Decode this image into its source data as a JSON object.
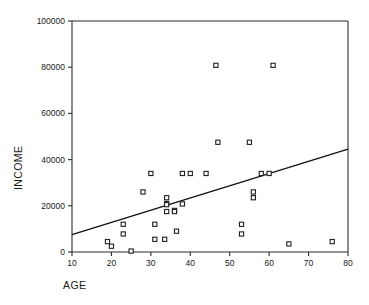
{
  "chart_data": {
    "type": "scatter",
    "title": "",
    "xlabel": "AGE",
    "ylabel": "INCOME",
    "xlim": [
      10,
      80
    ],
    "ylim": [
      0,
      100000
    ],
    "xticks": [
      10,
      20,
      30,
      40,
      50,
      60,
      70,
      80
    ],
    "yticks": [
      0,
      20000,
      40000,
      60000,
      80000,
      100000
    ],
    "xtick_labels": [
      "10",
      "20",
      "30",
      "40",
      "50",
      "60",
      "70",
      "80"
    ],
    "ytick_labels": [
      "0",
      "20000",
      "40000",
      "60000",
      "80000",
      "100000"
    ],
    "grid": false,
    "legend": "none",
    "marker": "open-square",
    "points": [
      {
        "x": 19,
        "y": 4500
      },
      {
        "x": 20,
        "y": 2500
      },
      {
        "x": 23,
        "y": 12000
      },
      {
        "x": 23,
        "y": 7800
      },
      {
        "x": 25,
        "y": 400
      },
      {
        "x": 28,
        "y": 26000
      },
      {
        "x": 30,
        "y": 34000
      },
      {
        "x": 31,
        "y": 12000
      },
      {
        "x": 31,
        "y": 5500
      },
      {
        "x": 33.5,
        "y": 5500
      },
      {
        "x": 34,
        "y": 23500
      },
      {
        "x": 34,
        "y": 21000
      },
      {
        "x": 34,
        "y": 20500
      },
      {
        "x": 34,
        "y": 17500
      },
      {
        "x": 36,
        "y": 18000
      },
      {
        "x": 36,
        "y": 17500
      },
      {
        "x": 36.5,
        "y": 9000
      },
      {
        "x": 38,
        "y": 34000
      },
      {
        "x": 38,
        "y": 20800
      },
      {
        "x": 40,
        "y": 34000
      },
      {
        "x": 44,
        "y": 34000
      },
      {
        "x": 46.5,
        "y": 80800
      },
      {
        "x": 47,
        "y": 47500
      },
      {
        "x": 53,
        "y": 12000
      },
      {
        "x": 53,
        "y": 7800
      },
      {
        "x": 55,
        "y": 47500
      },
      {
        "x": 56,
        "y": 26000
      },
      {
        "x": 56,
        "y": 23500
      },
      {
        "x": 58,
        "y": 34000
      },
      {
        "x": 60,
        "y": 34000
      },
      {
        "x": 61,
        "y": 80800
      },
      {
        "x": 65,
        "y": 3500
      },
      {
        "x": 76,
        "y": 4500
      }
    ],
    "fit_line": {
      "label": "linear-fit",
      "x_start": 10,
      "y_start": 7500,
      "x_end": 80,
      "y_end": 44500
    },
    "colors": {
      "axis": "#2b2b2b",
      "marker_stroke": "#1f1f1f",
      "marker_fill": "#ffffff",
      "fit_line": "#111111",
      "background": "#ffffff"
    }
  }
}
